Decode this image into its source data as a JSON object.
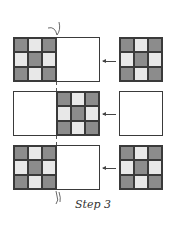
{
  "caption": "Step 3",
  "colors": {
    "dark": "#8c8c8c",
    "light": "#e8e8e8",
    "border": "#3a3a3a"
  },
  "rows": [
    {
      "grid_position": "left",
      "pattern": [
        "dark",
        "light",
        "dark",
        "light",
        "dark",
        "light",
        "dark",
        "light",
        "dark"
      ],
      "source_pattern": [
        "dark",
        "light",
        "dark",
        "light",
        "dark",
        "light",
        "dark",
        "light",
        "dark"
      ],
      "source_filled": true
    },
    {
      "grid_position": "right",
      "pattern": [
        "dark",
        "light",
        "dark",
        "light",
        "dark",
        "light",
        "dark",
        "light",
        "dark"
      ],
      "source_filled": false
    },
    {
      "grid_position": "left",
      "pattern": [
        "dark",
        "light",
        "dark",
        "light",
        "dark",
        "light",
        "dark",
        "light",
        "dark"
      ],
      "source_pattern": [
        "dark",
        "light",
        "dark",
        "light",
        "dark",
        "light",
        "dark",
        "light",
        "dark"
      ],
      "source_filled": true
    }
  ]
}
